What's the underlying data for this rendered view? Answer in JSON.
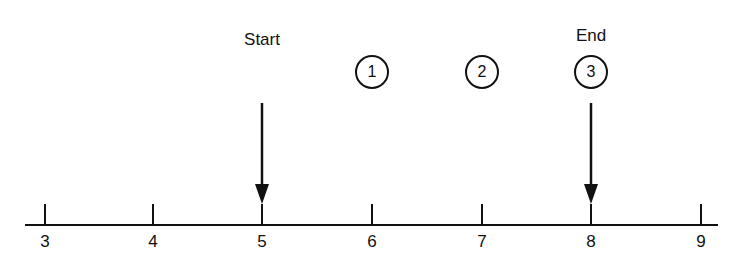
{
  "diagram": {
    "type": "timeline",
    "axis": {
      "min": 3,
      "max": 9,
      "ticks": [
        "3",
        "4",
        "5",
        "6",
        "7",
        "8",
        "9"
      ]
    },
    "markers": [
      {
        "label": "Start",
        "position": 5
      },
      {
        "label": "End",
        "position": 8
      }
    ],
    "steps": [
      {
        "label": "1",
        "position": 6
      },
      {
        "label": "2",
        "position": 7
      },
      {
        "label": "3",
        "position": 8
      }
    ],
    "colors": {
      "ink": "#111111",
      "background": "#ffffff"
    }
  }
}
